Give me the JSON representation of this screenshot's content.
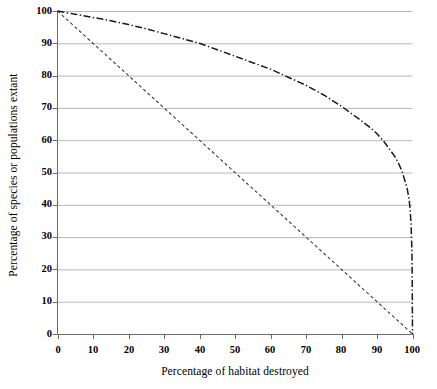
{
  "chart_data": {
    "type": "line",
    "title": "",
    "xlabel": "Percentage of habitat destroyed",
    "ylabel": "Percentage of species or populations extant",
    "xlim": [
      0,
      100
    ],
    "ylim": [
      0,
      100
    ],
    "xticks": [
      0,
      10,
      20,
      30,
      40,
      50,
      60,
      70,
      80,
      90,
      100
    ],
    "yticks": [
      0,
      10,
      20,
      30,
      40,
      50,
      60,
      70,
      80,
      90,
      100
    ],
    "grid": "horizontal",
    "legend": "none",
    "series": [
      {
        "name": "species-area curve",
        "style": "dash-dot",
        "color": "#1a1a1a",
        "x": [
          0,
          5,
          10,
          15,
          20,
          25,
          30,
          35,
          40,
          45,
          50,
          55,
          60,
          65,
          70,
          75,
          80,
          85,
          88,
          90,
          92,
          94,
          95,
          96,
          97,
          98,
          98.5,
          99,
          99.3,
          99.6,
          99.8,
          99.9,
          100
        ],
        "y": [
          100,
          99,
          98,
          97,
          95.8,
          94.5,
          93,
          91.5,
          90,
          88,
          86,
          84,
          82,
          79.5,
          77,
          74,
          70.5,
          66.5,
          64,
          62,
          59.5,
          56.5,
          55,
          53,
          50.5,
          47,
          45,
          42,
          39,
          34,
          27,
          20,
          0
        ]
      },
      {
        "name": "linear reference line",
        "style": "dashed",
        "color": "#3a3a3a",
        "x": [
          0,
          100
        ],
        "y": [
          100,
          0
        ]
      }
    ]
  },
  "axes": {
    "x_title": "Percentage of habitat destroyed",
    "y_title": "Percentage of species or populations extant",
    "x_tick_labels": [
      "0",
      "10",
      "20",
      "30",
      "40",
      "50",
      "60",
      "70",
      "80",
      "90",
      "100"
    ],
    "y_tick_labels": [
      "0",
      "10",
      "20",
      "30",
      "40",
      "50",
      "60",
      "70",
      "80",
      "90",
      "100"
    ]
  },
  "colors": {
    "background": "#ffffff",
    "axis": "#555555",
    "grid": "#b8b8b8",
    "curve_primary": "#1a1a1a",
    "curve_secondary": "#3a3a3a",
    "text": "#000000"
  }
}
